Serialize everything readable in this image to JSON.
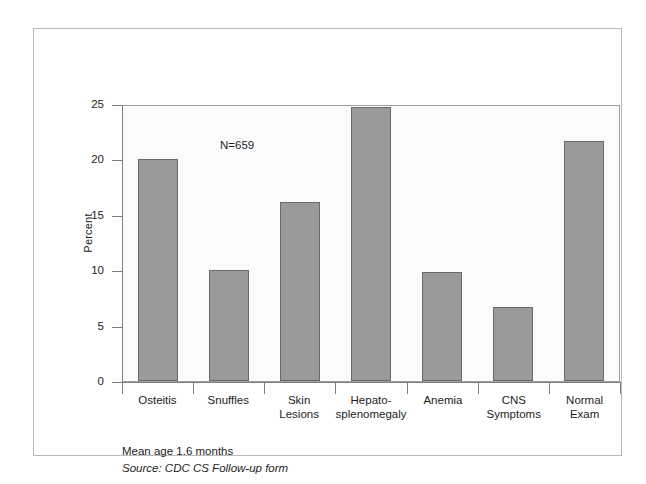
{
  "chart_data": {
    "type": "bar",
    "title": "",
    "subtitle": "",
    "xlabel": "",
    "ylabel": "Percent",
    "ylim": [
      0,
      25
    ],
    "yticks": [
      0,
      5,
      10,
      15,
      20,
      25
    ],
    "ytick_labels": [
      "0",
      "5",
      "10",
      "15",
      "20",
      "25"
    ],
    "grid": false,
    "legend": null,
    "categories": [
      "Osteitis",
      "Snuffles",
      "Skin Lesions",
      "Hepato-splenomegaly",
      "Anemia",
      "CNS Symptoms",
      "Normal Exam"
    ],
    "category_labels": [
      [
        "Osteitis"
      ],
      [
        "Snuffles"
      ],
      [
        "Skin",
        "Lesions"
      ],
      [
        "Hepato-",
        "splenomegaly"
      ],
      [
        "Anemia"
      ],
      [
        "CNS",
        "Symptoms"
      ],
      [
        "Normal",
        "Exam"
      ]
    ],
    "values": [
      20.0,
      10.0,
      16.2,
      24.7,
      9.8,
      6.7,
      21.7
    ],
    "annotations": [
      "N=659"
    ],
    "bar_color": "#9a9a9a",
    "bar_edge_color": "#6a6a6a",
    "plot_background": "#fbfbfb"
  },
  "annotation": {
    "sample_size": "N=659"
  },
  "notes": {
    "mean_age": "Mean age 1.6 months",
    "source": "Source: CDC CS Follow-up form"
  },
  "axis": {
    "y_title": "Percent"
  }
}
